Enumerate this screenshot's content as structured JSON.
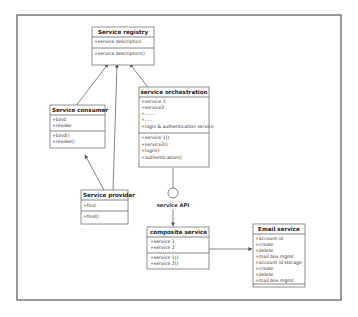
{
  "diagram": {
    "type": "uml-class-diagram",
    "classes": [
      {
        "id": "registry",
        "name": "Service registry",
        "attributes": [
          "+service description"
        ],
        "operations": [
          "+service description()"
        ]
      },
      {
        "id": "consumer",
        "name": "Service consumer",
        "attributes": [
          "+bind",
          "+revoke"
        ],
        "operations": [
          "+bind()",
          "+revoke()"
        ]
      },
      {
        "id": "orchestration",
        "name": "service orchestration",
        "attributes": [
          "+service 1",
          "+service2",
          "+.......",
          "+.....",
          "+login & authentication service"
        ],
        "operations": [
          "+service 1()",
          "+service2()",
          "+login()",
          "+authentication()"
        ]
      },
      {
        "id": "provider",
        "name": "Service provider",
        "attributes": [
          "+find"
        ],
        "operations": [
          "+find()"
        ]
      },
      {
        "id": "composite",
        "name": "composite service",
        "attributes": [
          "+service 1",
          "+service 2"
        ],
        "operations": [
          "+service 1()",
          "+service 2()"
        ]
      },
      {
        "id": "email",
        "name": "Email service",
        "attributes": [
          "+account id",
          "+create",
          "+delete",
          "+mail box mgmt",
          "+account id storage",
          "+create",
          "+delete",
          "+mail box mgmt"
        ],
        "operations": []
      }
    ],
    "interface_label": "service API",
    "edges": [
      {
        "from": "consumer",
        "to": "registry",
        "type": "association-arrow"
      },
      {
        "from": "provider",
        "to": "registry",
        "type": "association-arrow"
      },
      {
        "from": "orchestration",
        "to": "registry",
        "type": "association-arrow"
      },
      {
        "from": "provider",
        "to": "consumer",
        "type": "association-arrow"
      },
      {
        "from": "orchestration",
        "to": "service API",
        "type": "interface-lollipop"
      },
      {
        "from": "service API",
        "to": "composite",
        "type": "arrow"
      },
      {
        "from": "composite",
        "to": "email",
        "type": "arrow"
      }
    ]
  }
}
